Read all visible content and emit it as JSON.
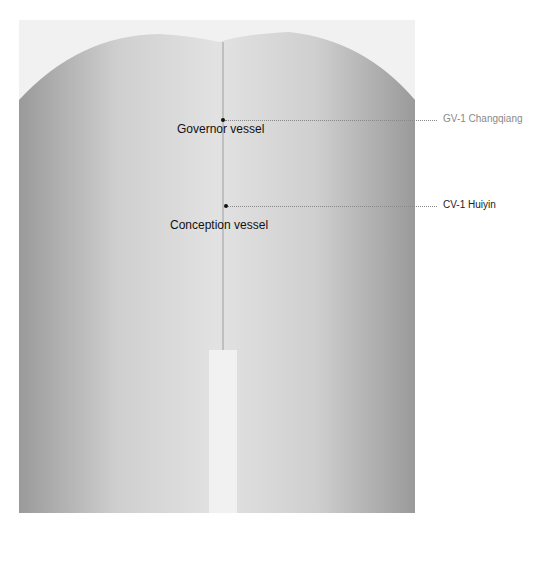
{
  "figure": {
    "background_color": "#f1f1f1"
  },
  "labels": {
    "governor_vessel": "Governor vessel",
    "conception_vessel": "Conception vessel"
  },
  "callouts": [
    {
      "id": "gv1",
      "text": "GV-1 Changqiang",
      "color": "#8a8a8a"
    },
    {
      "id": "cv1",
      "text": "CV-1 Huiyin",
      "color": "#222222"
    }
  ]
}
